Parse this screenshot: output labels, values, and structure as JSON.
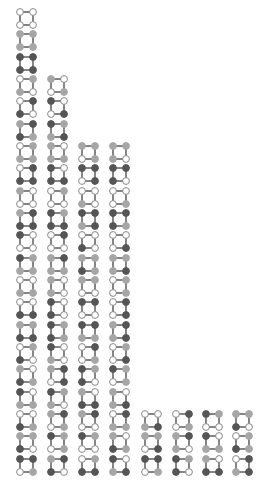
{
  "diagram": {
    "type": "graph-configuration-grid",
    "node_order": [
      "top-left",
      "top-right",
      "bottom-left",
      "bottom-right"
    ],
    "color_legend": {
      "W": "#ffffff",
      "L": "#a6a6a6",
      "D": "#555555"
    },
    "stroke_color": "#888888",
    "edge_color": "#666666",
    "column_x": [
      27,
      58,
      89,
      120,
      152,
      183,
      213,
      243
    ],
    "row_y": [
      19,
      41,
      64,
      86,
      108,
      131,
      153,
      175,
      198,
      220,
      242,
      265,
      287,
      309,
      332,
      354,
      376,
      399,
      421,
      443,
      466
    ],
    "columns": [
      {
        "start_row": 0,
        "glyphs": [
          "WWWW",
          "LLLL",
          "DDDD",
          "WLLW",
          "WDDW",
          "LDDL",
          "WLLL",
          "WDDD",
          "LWWW",
          "LDDD",
          "DWWW",
          "DLLL",
          "WWLL",
          "WWDD",
          "LLDD",
          "WLDW",
          "LWDL",
          "DWLL",
          "WWDL",
          "LLDW",
          "DDWL"
        ]
      },
      {
        "start_row": 3,
        "glyphs": [
          "LWWL",
          "DWWD",
          "DLLD",
          "LWLL",
          "DWDD",
          "WLWW",
          "DLDD",
          "WDWW",
          "LDLL",
          "LWLW",
          "DWDW",
          "DLDL",
          "DWLW",
          "LDWD",
          "DLLW",
          "LDWL",
          "DLWL",
          "LDDW"
        ]
      },
      {
        "start_row": 6,
        "glyphs": [
          "LLWL",
          "DDWD",
          "WWLW",
          "DDLD",
          "WWDW",
          "LLDL",
          "LLWW",
          "DDWW",
          "DDLL",
          "WDWL",
          "DLDW",
          "LWDD",
          "LDWW",
          "DLWW",
          "WLDD"
        ]
      },
      {
        "start_row": 6,
        "glyphs": [
          "LLLW",
          "DDDW",
          "WWWL",
          "DDDL",
          "WWWD",
          "LLLD",
          "WLWL",
          "WDWD",
          "LDLD",
          "WLWD",
          "DLWL",
          "LWLD",
          "WDLL",
          "LWDL",
          "DWLD"
        ]
      },
      {
        "start_row": 18,
        "glyphs": [
          "WWLD",
          "LLWD",
          "DDWL"
        ]
      },
      {
        "start_row": 18,
        "glyphs": [
          "WDWL",
          "LDLW",
          "DLDW"
        ]
      },
      {
        "start_row": 18,
        "glyphs": [
          "DLWW",
          "DWLL",
          "LWDD"
        ]
      },
      {
        "start_row": 18,
        "glyphs": [
          "LLDW",
          "WLDL",
          "WDLD"
        ]
      }
    ],
    "column_counts": [
      21,
      18,
      15,
      15,
      3,
      3,
      3,
      3
    ]
  }
}
